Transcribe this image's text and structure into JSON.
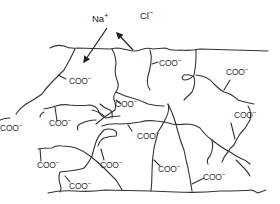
{
  "diagram": {
    "colors": {
      "line": "#333333",
      "text": "#333333",
      "background": "#ffffff"
    },
    "ions": [
      {
        "base": "Na",
        "charge": "+",
        "x": 92,
        "y": 14,
        "direction": "in"
      },
      {
        "base": "Cl",
        "charge": "−",
        "x": 140,
        "y": 11,
        "direction": "out"
      }
    ],
    "group_labels": [
      {
        "base": "COO",
        "charge": "−",
        "x": 69,
        "y": 77
      },
      {
        "base": "COO",
        "charge": "−",
        "x": 159,
        "y": 59
      },
      {
        "base": "COO",
        "charge": "−",
        "x": 226,
        "y": 68
      },
      {
        "base": "COO",
        "charge": "−",
        "x": 115,
        "y": 100
      },
      {
        "base": "COO",
        "charge": "−",
        "x": 49,
        "y": 119
      },
      {
        "base": "COO",
        "charge": "−",
        "x": 234,
        "y": 111
      },
      {
        "base": "COO",
        "charge": "−",
        "x": 137,
        "y": 132
      },
      {
        "base": "COO",
        "charge": "−",
        "x": 0,
        "y": 124
      },
      {
        "base": "COO",
        "charge": "−",
        "x": 37,
        "y": 161
      },
      {
        "base": "COO",
        "charge": "−",
        "x": 100,
        "y": 161
      },
      {
        "base": "COO",
        "charge": "−",
        "x": 158,
        "y": 165
      },
      {
        "base": "COO",
        "charge": "−",
        "x": 203,
        "y": 173
      },
      {
        "base": "COO",
        "charge": "−",
        "x": 69,
        "y": 182
      }
    ]
  }
}
